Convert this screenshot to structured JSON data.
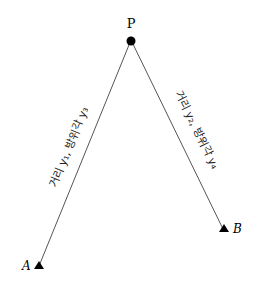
{
  "points": {
    "P": {
      "label": "P",
      "x": 131,
      "y": 40
    },
    "A": {
      "label": "A",
      "x": 39,
      "y": 266
    },
    "B": {
      "label": "B",
      "x": 223,
      "y": 229
    }
  },
  "edges": {
    "PA": {
      "label": "거리 y₁, 방위각 y₃"
    },
    "PB": {
      "label": "거리 y₂, 방위각 y₄"
    }
  },
  "colors": {
    "line": "#555555",
    "marker": "#000000"
  }
}
